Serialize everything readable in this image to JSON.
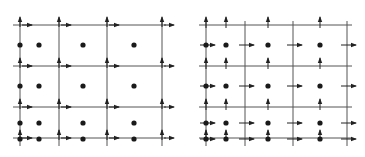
{
  "diagrams": [
    {
      "name": "left-grid",
      "description": "Staggered grid with arrows at grid-line intersections",
      "vertical_lines_x": [
        20,
        59,
        107,
        162
      ],
      "horizontal_lines_y": [
        25,
        66,
        107,
        138
      ],
      "x_extent": [
        13,
        170
      ],
      "y_extent": [
        17,
        146
      ],
      "dots_x": [
        20,
        39,
        83,
        134
      ],
      "dots_y": [
        45,
        86,
        123,
        139
      ],
      "arrow_mode": "at-intersections"
    },
    {
      "name": "right-grid",
      "description": "Staggered grid with arrows at face midpoints",
      "vertical_lines_x": [
        206,
        245,
        293,
        347
      ],
      "horizontal_lines_y": [
        25,
        66,
        107,
        138
      ],
      "x_extent": [
        199,
        356
      ],
      "y_extent": [
        17,
        146
      ],
      "dots_x": [
        206,
        226,
        268,
        320
      ],
      "dots_y": [
        45,
        86,
        123,
        139
      ],
      "arrow_mode": "at-faces"
    }
  ],
  "colors": {
    "line": "#555555",
    "dot": "#1a1a1a",
    "arrow": "#222222",
    "background": "#ffffff"
  }
}
